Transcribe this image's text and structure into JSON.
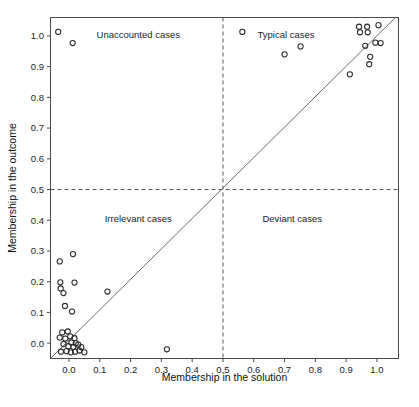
{
  "chart_data": {
    "type": "scatter",
    "title": "",
    "xlabel": "Membership in the solution",
    "ylabel": "Membership in the outcome",
    "xlim": [
      -0.06,
      1.07
    ],
    "ylim": [
      -0.05,
      1.06
    ],
    "xticks": [
      0.0,
      0.1,
      0.2,
      0.3,
      0.4,
      0.5,
      0.6,
      0.7,
      0.8,
      0.9,
      1.0
    ],
    "yticks": [
      0.0,
      0.1,
      0.2,
      0.3,
      0.4,
      0.5,
      0.6,
      0.7,
      0.8,
      0.9,
      1.0
    ],
    "xticklabels": [
      "0.0",
      "0.1",
      "0.2",
      "0.3",
      "0.4",
      "0.5",
      "0.6",
      "0.7",
      "0.8",
      "0.9",
      "1.0"
    ],
    "yticklabels": [
      "0.0",
      "0.1",
      "0.2",
      "0.3",
      "0.4",
      "0.5",
      "0.6",
      "0.7",
      "0.8",
      "0.9",
      "1.0"
    ],
    "grid": false,
    "legend": false,
    "marker": "open-circle",
    "marker_size": 5.2,
    "reference_lines": [
      {
        "name": "x-threshold",
        "orientation": "vertical",
        "value": 0.5,
        "style": "dashed"
      },
      {
        "name": "y-threshold",
        "orientation": "horizontal",
        "value": 0.5,
        "style": "dashed"
      },
      {
        "name": "diagonal",
        "orientation": "diagonal",
        "from": [
          -0.06,
          -0.05
        ],
        "to": [
          1.06,
          1.06
        ],
        "style": "solid"
      }
    ],
    "annotations": [
      {
        "text": "Unaccounted cases",
        "x": 0.225,
        "y": 1.005,
        "quadrant": "top-left"
      },
      {
        "text": "Typical cases",
        "x": 0.705,
        "y": 1.005,
        "quadrant": "top-right"
      },
      {
        "text": "Irrelevant cases",
        "x": 0.225,
        "y": 0.405,
        "quadrant": "bottom-left"
      },
      {
        "text": "Deviant cases",
        "x": 0.725,
        "y": 0.405,
        "quadrant": "bottom-right"
      }
    ],
    "points": [
      [
        -0.035,
        1.013
      ],
      [
        0.012,
        0.977
      ],
      [
        0.563,
        1.013
      ],
      [
        0.942,
        1.03
      ],
      [
        0.968,
        1.03
      ],
      [
        0.945,
        1.012
      ],
      [
        0.97,
        1.012
      ],
      [
        1.005,
        1.035
      ],
      [
        0.995,
        0.978
      ],
      [
        1.012,
        0.977
      ],
      [
        0.962,
        0.968
      ],
      [
        0.752,
        0.966
      ],
      [
        0.7,
        0.94
      ],
      [
        0.978,
        0.932
      ],
      [
        0.975,
        0.908
      ],
      [
        0.912,
        0.875
      ],
      [
        -0.03,
        0.266
      ],
      [
        0.013,
        0.29
      ],
      [
        -0.028,
        0.198
      ],
      [
        0.018,
        0.197
      ],
      [
        -0.027,
        0.178
      ],
      [
        -0.018,
        0.163
      ],
      [
        0.125,
        0.168
      ],
      [
        -0.013,
        0.121
      ],
      [
        0.01,
        0.103
      ],
      [
        -0.022,
        0.035
      ],
      [
        -0.004,
        0.038
      ],
      [
        -0.03,
        0.018
      ],
      [
        -0.012,
        0.015
      ],
      [
        0.004,
        0.022
      ],
      [
        0.018,
        0.016
      ],
      [
        0.008,
        0.002
      ],
      [
        0.022,
        0.0
      ],
      [
        -0.018,
        -0.003
      ],
      [
        -0.002,
        -0.01
      ],
      [
        0.014,
        -0.012
      ],
      [
        0.03,
        -0.005
      ],
      [
        0.04,
        -0.013
      ],
      [
        -0.026,
        -0.028
      ],
      [
        -0.008,
        -0.026
      ],
      [
        0.006,
        -0.03
      ],
      [
        0.02,
        -0.028
      ],
      [
        0.034,
        -0.024
      ],
      [
        0.05,
        -0.03
      ],
      [
        0.318,
        -0.02
      ]
    ]
  },
  "figure": {
    "background_color": "#ffffff",
    "axis_color": "#4a4a4a",
    "marker_color": "#2b2b2b",
    "reference_color": "#555555"
  }
}
